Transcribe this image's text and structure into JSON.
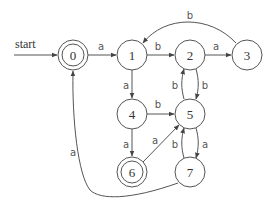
{
  "diagram": {
    "type": "finite-automaton",
    "start_label": "start",
    "start_state": "0",
    "accepting_states": [
      "0",
      "6"
    ],
    "states": [
      {
        "id": "0",
        "label": "0",
        "accepting": true
      },
      {
        "id": "1",
        "label": "1",
        "accepting": false
      },
      {
        "id": "2",
        "label": "2",
        "accepting": false
      },
      {
        "id": "3",
        "label": "3",
        "accepting": false
      },
      {
        "id": "4",
        "label": "4",
        "accepting": false
      },
      {
        "id": "5",
        "label": "5",
        "accepting": false
      },
      {
        "id": "6",
        "label": "6",
        "accepting": true
      },
      {
        "id": "7",
        "label": "7",
        "accepting": false
      }
    ],
    "transitions": [
      {
        "from": "0",
        "to": "1",
        "label": "a"
      },
      {
        "from": "1",
        "to": "2",
        "label": "b"
      },
      {
        "from": "2",
        "to": "3",
        "label": "a"
      },
      {
        "from": "3",
        "to": "1",
        "label": "b"
      },
      {
        "from": "1",
        "to": "4",
        "label": "a"
      },
      {
        "from": "4",
        "to": "5",
        "label": "b"
      },
      {
        "from": "4",
        "to": "6",
        "label": "a"
      },
      {
        "from": "6",
        "to": "5",
        "label": "a"
      },
      {
        "from": "2",
        "to": "5",
        "label": "b"
      },
      {
        "from": "5",
        "to": "2",
        "label": "b"
      },
      {
        "from": "5",
        "to": "7",
        "label": "a"
      },
      {
        "from": "7",
        "to": "5",
        "label": "b"
      },
      {
        "from": "7",
        "to": "0",
        "label": "a"
      }
    ]
  }
}
